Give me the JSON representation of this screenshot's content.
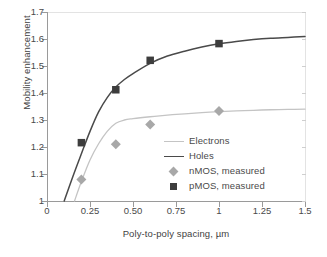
{
  "chart_data": {
    "type": "line",
    "title": "",
    "xlabel": "Poly-to-poly spacing, µm",
    "ylabel": "Mobility enhancement",
    "xlim": [
      0,
      1.5
    ],
    "ylim": [
      1,
      1.7
    ],
    "grid": false,
    "legend_position": "inside-center-right",
    "xticks": [
      "0",
      "0.25",
      "0.50",
      "0.75",
      "1",
      "1.25",
      "1.5"
    ],
    "xtick_values": [
      0,
      0.25,
      0.5,
      0.75,
      1,
      1.25,
      1.5
    ],
    "yticks": [
      "1",
      "1.1",
      "1.2",
      "1.3",
      "1.4",
      "1.5",
      "1.6",
      "1.7"
    ],
    "ytick_values": [
      1,
      1.1,
      1.2,
      1.3,
      1.4,
      1.5,
      1.6,
      1.7
    ],
    "series": [
      {
        "name": "Electrons",
        "kind": "line",
        "color": "#c4c4c4",
        "x": [
          0.16,
          0.2,
          0.25,
          0.3,
          0.35,
          0.4,
          0.45,
          0.5,
          0.6,
          0.7,
          0.8,
          0.9,
          1.0,
          1.1,
          1.2,
          1.3,
          1.4,
          1.5
        ],
        "y": [
          1.0,
          1.072,
          1.152,
          1.212,
          1.258,
          1.288,
          1.3,
          1.305,
          1.312,
          1.318,
          1.323,
          1.327,
          1.331,
          1.334,
          1.336,
          1.338,
          1.339,
          1.34
        ]
      },
      {
        "name": "Holes",
        "kind": "line",
        "color": "#4a4a4a",
        "x": [
          0.1,
          0.15,
          0.2,
          0.25,
          0.3,
          0.35,
          0.4,
          0.45,
          0.5,
          0.6,
          0.7,
          0.8,
          0.9,
          1.0,
          1.1,
          1.2,
          1.3,
          1.4,
          1.5
        ],
        "y": [
          1.0,
          1.09,
          1.175,
          1.258,
          1.33,
          1.383,
          1.422,
          1.45,
          1.472,
          1.51,
          1.537,
          1.555,
          1.57,
          1.582,
          1.591,
          1.598,
          1.603,
          1.606,
          1.609
        ]
      },
      {
        "name": "nMOS, measured",
        "kind": "scatter",
        "marker": "diamond",
        "color": "#a8a8a8",
        "x": [
          0.2,
          0.4,
          0.6,
          1.0
        ],
        "y": [
          1.08,
          1.21,
          1.283,
          1.333
        ]
      },
      {
        "name": "pMOS, measured",
        "kind": "scatter",
        "marker": "square",
        "color": "#3d3d3d",
        "x": [
          0.2,
          0.4,
          0.6,
          1.0
        ],
        "y": [
          1.216,
          1.412,
          1.521,
          1.583
        ]
      }
    ],
    "legend": [
      {
        "label": "Electrons",
        "type": "line",
        "color": "#c4c4c4"
      },
      {
        "label": "Holes",
        "type": "line",
        "color": "#4a4a4a"
      },
      {
        "label": "nMOS, measured",
        "type": "diamond",
        "color": "#a8a8a8"
      },
      {
        "label": "pMOS, measured",
        "type": "square",
        "color": "#3d3d3d"
      }
    ]
  }
}
